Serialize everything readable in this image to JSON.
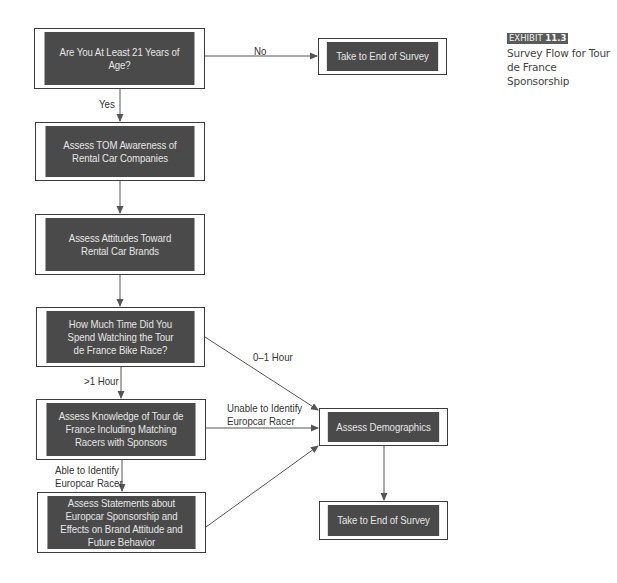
{
  "exhibit": {
    "tag": "EXHIBIT",
    "number": "11.3",
    "title": "Survey Flow for Tour de France Sponsorship"
  },
  "colors": {
    "box_fill": "#4a4a4a",
    "box_text": "#e6e6e6",
    "line": "#555555",
    "label_text": "#333333",
    "exhibit_tag_bg": "#5a5a5a"
  },
  "nodes": [
    {
      "id": "age-question",
      "label": "Are You At Least 21 Years of Age?",
      "x": 34,
      "y": 28,
      "w": 171,
      "h": 61
    },
    {
      "id": "end-survey-top",
      "label": "Take to End of Survey",
      "x": 318,
      "y": 38,
      "w": 129,
      "h": 37
    },
    {
      "id": "tom-awareness",
      "label": "Assess TOM Awareness of Rental Car Companies",
      "x": 35,
      "y": 122,
      "w": 170,
      "h": 59
    },
    {
      "id": "attitudes",
      "label": "Assess Attitudes Toward Rental Car Brands",
      "x": 35,
      "y": 214,
      "w": 170,
      "h": 61
    },
    {
      "id": "time-watching",
      "label": "How Much Time Did You Spend Watching the Tour de France Bike Race?",
      "x": 36,
      "y": 307,
      "w": 169,
      "h": 60
    },
    {
      "id": "knowledge",
      "label": "Assess Knowledge of Tour de France Including Matching Racers with Sponsors",
      "x": 36,
      "y": 399,
      "w": 170,
      "h": 61
    },
    {
      "id": "statements",
      "label": "Assess Statements about Europcar Sponsorship and Effects on Brand Attitude and Future Behavior",
      "x": 37,
      "y": 492,
      "w": 169,
      "h": 61
    },
    {
      "id": "demographics",
      "label": "Assess Demographics",
      "x": 319,
      "y": 408,
      "w": 129,
      "h": 38
    },
    {
      "id": "end-survey-bottom",
      "label": "Take to End of Survey",
      "x": 319,
      "y": 501,
      "w": 129,
      "h": 39
    }
  ],
  "edges": [
    {
      "from": "age-question",
      "to": "end-survey-top",
      "label": "No"
    },
    {
      "from": "age-question",
      "to": "tom-awareness",
      "label": "Yes"
    },
    {
      "from": "tom-awareness",
      "to": "attitudes",
      "label": ""
    },
    {
      "from": "attitudes",
      "to": "time-watching",
      "label": ""
    },
    {
      "from": "time-watching",
      "to": "demographics",
      "label": "0–1 Hour"
    },
    {
      "from": "time-watching",
      "to": "knowledge",
      "label": ">1 Hour"
    },
    {
      "from": "knowledge",
      "to": "demographics",
      "label": "Unable to Identify\nEuropcar Racer"
    },
    {
      "from": "knowledge",
      "to": "statements",
      "label": "Able to Identify\nEuropcar Racer"
    },
    {
      "from": "statements",
      "to": "demographics",
      "label": ""
    },
    {
      "from": "demographics",
      "to": "end-survey-bottom",
      "label": ""
    }
  ]
}
